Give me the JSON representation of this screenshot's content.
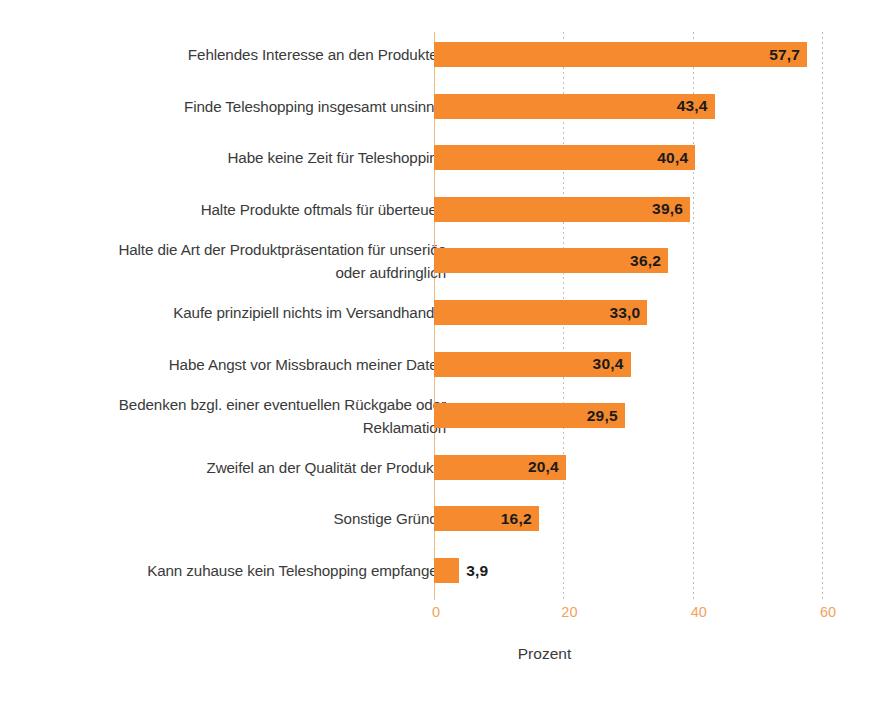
{
  "chart_data": {
    "type": "bar",
    "orientation": "horizontal",
    "title": "",
    "xlabel": "Prozent",
    "ylabel": "",
    "xlim": [
      0,
      60
    ],
    "xticks": [
      "0",
      "20",
      "40",
      "60"
    ],
    "xtick_values": [
      0,
      20,
      40,
      60
    ],
    "grid": true,
    "legend": false,
    "value_format": "comma-decimal",
    "categories": [
      "Fehlendes Interesse an den Produkten",
      "Finde Teleshopping insgesamt unsinnig",
      "Habe keine Zeit für Teleshopping",
      "Halte Produkte oftmals für überteuert",
      "Halte die Art der Produktpräsentation für unseriös oder aufdringlich",
      "Kaufe prinzipiell nichts im Versandhandel",
      "Habe Angst vor Missbrauch meiner Daten",
      "Bedenken bzgl. einer eventuellen Rückgabe oder Reklamation",
      "Zweifel an der Qualität der Produkte",
      "Sonstige Gründe",
      "Kann zuhause kein Teleshopping empfangen"
    ],
    "values": [
      57.7,
      43.4,
      40.4,
      39.6,
      36.2,
      33.0,
      30.4,
      29.5,
      20.4,
      16.2,
      3.9
    ],
    "value_labels": [
      "57,7",
      "43,4",
      "40,4",
      "39,6",
      "36,2",
      "33,0",
      "30,4",
      "29,5",
      "20,4",
      "16,2",
      "3,9"
    ],
    "colors": {
      "bar": "#f58a2e",
      "value_label": "#1a1a1a",
      "category_label": "#3a3a3a",
      "tick_label": "#f0a35c",
      "gridline": "#bdbdbd",
      "axis_line": "#f0b884",
      "background": "#ffffff"
    }
  },
  "rows": [
    {
      "label": "Fehlendes Interesse an den Produkten",
      "label_lines": [
        "Fehlendes Interesse an den Produkten"
      ],
      "value": 57.7,
      "value_label": "57,7"
    },
    {
      "label": "Finde Teleshopping insgesamt unsinnig",
      "label_lines": [
        "Finde Teleshopping insgesamt unsinnig"
      ],
      "value": 43.4,
      "value_label": "43,4"
    },
    {
      "label": "Habe keine Zeit für Teleshopping",
      "label_lines": [
        "Habe keine Zeit für Teleshopping"
      ],
      "value": 40.4,
      "value_label": "40,4"
    },
    {
      "label": "Halte Produkte oftmals für überteuert",
      "label_lines": [
        "Halte Produkte oftmals für überteuert"
      ],
      "value": 39.6,
      "value_label": "39,6"
    },
    {
      "label": "Halte die Art der Produktpräsentation für unseriös oder aufdringlich",
      "label_lines": [
        "Halte die Art der Produktpräsentation für unseriös",
        "oder aufdringlich"
      ],
      "value": 36.2,
      "value_label": "36,2"
    },
    {
      "label": "Kaufe prinzipiell nichts im Versandhandel",
      "label_lines": [
        "Kaufe prinzipiell nichts im Versandhandel"
      ],
      "value": 33.0,
      "value_label": "33,0"
    },
    {
      "label": "Habe Angst vor Missbrauch meiner Daten",
      "label_lines": [
        "Habe Angst vor Missbrauch meiner Daten"
      ],
      "value": 30.4,
      "value_label": "30,4"
    },
    {
      "label": "Bedenken bzgl. einer eventuellen Rückgabe oder Reklamation",
      "label_lines": [
        "Bedenken bzgl. einer eventuellen Rückgabe oder",
        "Reklamation"
      ],
      "value": 29.5,
      "value_label": "29,5"
    },
    {
      "label": "Zweifel an der Qualität der Produkte",
      "label_lines": [
        "Zweifel an der Qualität der Produkte"
      ],
      "value": 20.4,
      "value_label": "20,4"
    },
    {
      "label": "Sonstige Gründe",
      "label_lines": [
        "Sonstige Gründe"
      ],
      "value": 16.2,
      "value_label": "16,2"
    },
    {
      "label": "Kann zuhause kein Teleshopping empfangen",
      "label_lines": [
        "Kann zuhause kein Teleshopping empfangen"
      ],
      "value": 3.9,
      "value_label": "3,9"
    }
  ],
  "axis": {
    "ticks": [
      "0",
      "20",
      "40",
      "60"
    ],
    "title": "Prozent"
  }
}
